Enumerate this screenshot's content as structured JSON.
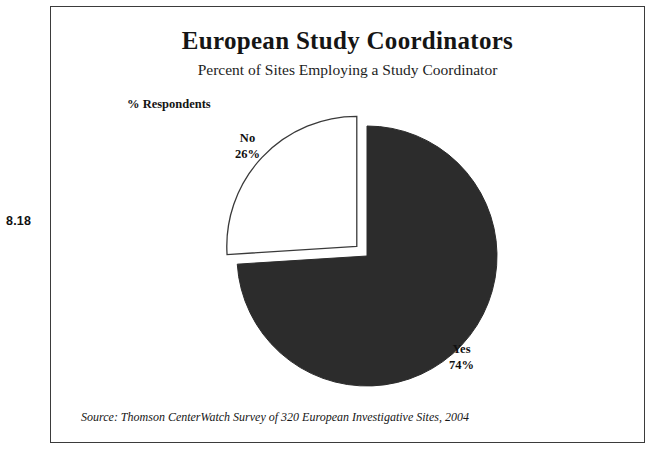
{
  "figure": {
    "number": "8.18"
  },
  "header": {
    "title": "European Study Coordinators",
    "subtitle": "Percent of Sites Employing a Study Coordinator"
  },
  "axis": {
    "respondents_label": "% Respondents"
  },
  "footer": {
    "source": "Source:  Thomson CenterWatch Survey of 320 European Investigative Sites, 2004"
  },
  "labels": {
    "no_name": "No",
    "no_value": "26%",
    "yes_name": "Yes",
    "yes_value": "74%"
  },
  "colors": {
    "yes_fill": "#2c2c2c",
    "no_fill": "#ffffff",
    "slice_stroke": "#3a3a3a",
    "frame": "#3b3b3b",
    "text": "#101010",
    "background": "#ffffff"
  },
  "chart_data": {
    "type": "pie",
    "title": "European Study Coordinators",
    "subtitle": "Percent of Sites Employing a Study Coordinator",
    "ylabel": "% Respondents",
    "xlabel": "",
    "categories": [
      "Yes",
      "No"
    ],
    "values": [
      74,
      26
    ],
    "value_labels": [
      "74%",
      "26%"
    ],
    "units": "percent",
    "total": 100,
    "start_angle_deg": 0,
    "direction": "clockwise",
    "exploded_slices": [
      "No"
    ],
    "slice_colors": [
      "#2c2c2c",
      "#ffffff"
    ],
    "legend": false,
    "grid": false,
    "data_labels": true,
    "annotations": [
      "Source:  Thomson CenterWatch Survey of 320 European Investigative Sites, 2004"
    ],
    "sample_size": 320,
    "sample_description": "European Investigative Sites",
    "survey_year": 2004,
    "survey_source": "Thomson CenterWatch"
  }
}
